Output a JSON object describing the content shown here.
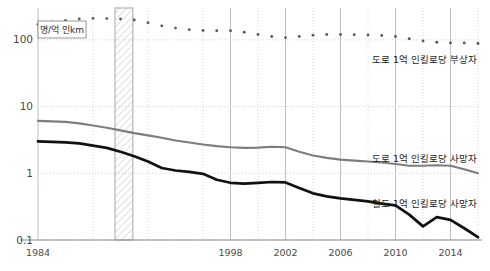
{
  "chart_data": {
    "type": "line",
    "title": "",
    "subtitle": "",
    "xlabel": "",
    "ylabel": "",
    "unit_label": "명/억 인km",
    "yscale": "log",
    "ylim": [
      0.1,
      300
    ],
    "xlim": [
      1984,
      2016
    ],
    "grid": true,
    "legend_position": "inline-right",
    "y_ticks": [
      "100",
      "10",
      "1",
      "0.1"
    ],
    "y_tick_values": [
      100,
      10,
      1,
      0.1
    ],
    "x_ticks": [
      "1984",
      "1998",
      "2002",
      "2006",
      "2010",
      "2014"
    ],
    "x_tick_values": [
      1984,
      1998,
      2002,
      2006,
      2010,
      2014
    ],
    "x_minor_values": [
      1988,
      1992,
      1996,
      2000,
      2004,
      2008,
      2012,
      2016
    ],
    "shaded_band": {
      "label": "",
      "x_start": 1989.6,
      "x_end": 1990.9,
      "style": "diagonal-hatch"
    },
    "x": [
      1984,
      1985,
      1986,
      1987,
      1988,
      1989,
      1990,
      1991,
      1992,
      1993,
      1994,
      1995,
      1996,
      1997,
      1998,
      1999,
      2000,
      2001,
      2002,
      2003,
      2004,
      2005,
      2006,
      2007,
      2008,
      2009,
      2010,
      2011,
      2012,
      2013,
      2014,
      2015,
      2016
    ],
    "series": [
      {
        "name": "도로 1억 인킬로당 부상자",
        "style": "dotted",
        "color": "#5a5a5a",
        "values": [
          170,
          185,
          196,
          205,
          210,
          208,
          205,
          198,
          180,
          162,
          150,
          142,
          138,
          137,
          137,
          130,
          120,
          112,
          108,
          112,
          117,
          120,
          120,
          119,
          118,
          116,
          112,
          104,
          96,
          92,
          90,
          90,
          88
        ]
      },
      {
        "name": "도로 1억 인킬로당 사망자",
        "style": "solid",
        "color": "#7d7d7d",
        "values": [
          6.1,
          6.0,
          5.9,
          5.6,
          5.2,
          4.8,
          4.4,
          4.0,
          3.7,
          3.4,
          3.1,
          2.9,
          2.7,
          2.55,
          2.45,
          2.4,
          2.42,
          2.5,
          2.45,
          2.1,
          1.85,
          1.7,
          1.6,
          1.55,
          1.5,
          1.45,
          1.38,
          1.3,
          1.3,
          1.32,
          1.3,
          1.15,
          1.0
        ]
      },
      {
        "name": "철도 1억 인킬로당 사망자",
        "style": "solid-bold",
        "color": "#111111",
        "values": [
          3.0,
          2.95,
          2.9,
          2.8,
          2.6,
          2.4,
          2.1,
          1.8,
          1.5,
          1.2,
          1.1,
          1.05,
          0.98,
          0.8,
          0.72,
          0.7,
          0.72,
          0.74,
          0.73,
          0.6,
          0.5,
          0.45,
          0.42,
          0.4,
          0.38,
          0.35,
          0.33,
          0.24,
          0.16,
          0.22,
          0.2,
          0.15,
          0.11
        ]
      }
    ]
  },
  "labels": {
    "injuries_road": "도로 1억 인킬로당 부상자",
    "deaths_road": "도로 1억 인킬로당 사망자",
    "deaths_rail": "철도 1억 인킬로당 사망자",
    "unit": "명/억 인km"
  },
  "axis": {
    "y": [
      {
        "text": "100"
      },
      {
        "text": "10"
      },
      {
        "text": "1"
      },
      {
        "text": "0.1"
      }
    ],
    "x": [
      {
        "text": "1984"
      },
      {
        "text": "1998"
      },
      {
        "text": "2002"
      },
      {
        "text": "2006"
      },
      {
        "text": "2010"
      },
      {
        "text": "2014"
      }
    ]
  },
  "colors": {
    "injuries": "#5a5a5a",
    "road_deaths": "#7d7d7d",
    "rail_deaths": "#111111",
    "grid_major": "#b8b8b8",
    "grid_minor": "#cfcfcf",
    "axis": "#8a8a8a",
    "text": "#3a3a3a"
  }
}
